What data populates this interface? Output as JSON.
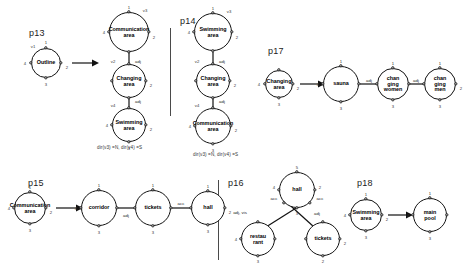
{
  "figure": {
    "panels": [
      "p13",
      "p14",
      "p15",
      "p16",
      "p17",
      "p18"
    ]
  },
  "labels": {
    "p13": "p13",
    "p14": "p14",
    "p15": "p15",
    "p16": "p16",
    "p17": "p17",
    "p18": "p18"
  },
  "captions": {
    "p13": "dir(v3) =N, dir(v4) =S",
    "p14": "dir(v3) =N, dir(v4) =S"
  },
  "nodes": {
    "outline": "Outline",
    "communication_area": "Communication\narea",
    "changing_area": "Changing\narea",
    "swimming_area": "Swimming\narea",
    "changing_area_p17": "Changing\narea",
    "sauna": "sauna",
    "changing_women": "chan\nging\nwomen",
    "changing_men": "chan\nging\nmen",
    "communication_area_p15": "Communication\narea",
    "corridor": "corridor",
    "tickets": "tickets",
    "hall": "hall",
    "restaurant": "restau\nrant",
    "swimming_area_p18": "Swimming\narea",
    "main_pool": "main\npool"
  },
  "vertex_tags": {
    "v1": "v1",
    "v2": "v2",
    "v3": "v3",
    "v4": "v4"
  },
  "port_numbers": {
    "n1": "1",
    "n2": "2",
    "n3": "3",
    "n4": "4",
    "n5": "5"
  },
  "edge_labels": {
    "adj": "adj",
    "acc": "acc",
    "adj_vis": "adj, vis"
  },
  "colors": {
    "stroke": "#111111",
    "text": "#1a1a1a",
    "divider": "#4a4a4a",
    "background": "#ffffff"
  }
}
